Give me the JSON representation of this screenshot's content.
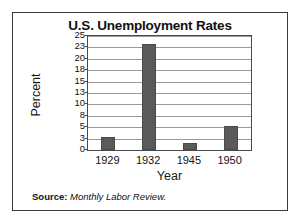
{
  "chart_data": {
    "type": "bar",
    "title": "U.S. Unemployment Rates",
    "xlabel": "Year",
    "ylabel": "Percent",
    "categories": [
      "1929",
      "1932",
      "1945",
      "1950"
    ],
    "values": [
      3.2,
      23.6,
      1.9,
      5.3
    ],
    "ylim": [
      0,
      25
    ],
    "ytick_labels": [
      "0",
      "3",
      "5",
      "8",
      "10",
      "13",
      "15",
      "18",
      "20",
      "23",
      "25"
    ],
    "ytick_values": [
      0,
      3,
      5,
      8,
      10,
      13,
      15,
      18,
      20,
      23,
      25
    ],
    "grid": true,
    "legend": false,
    "bar_color": "#5a5a5a",
    "gridline_color": "#9a9a9a",
    "frame_color": "#3a3a3a"
  },
  "source": {
    "label": "Source:",
    "value": "Monthly Labor Review."
  }
}
